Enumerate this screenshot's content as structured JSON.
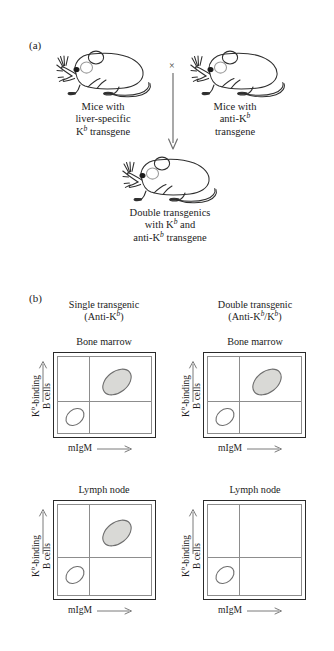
{
  "figure": {
    "panel_a": {
      "letter": "(a)",
      "parent_left": {
        "line1": "Mice with",
        "line2": "liver-specific",
        "line3_pre": "K",
        "line3_sup": "b",
        "line3_post": " transgene"
      },
      "parent_right": {
        "line1": "Mice with",
        "line2_pre": "anti-K",
        "line2_sup": "b",
        "line3": "transgene"
      },
      "cross_symbol": "×",
      "offspring": {
        "line1": "Double transgenics",
        "line2_pre": "with K",
        "line2_sup": "b",
        "line2_post": " and",
        "line3_pre": "anti-K",
        "line3_sup": "b",
        "line3_post": " transgene"
      }
    },
    "panel_b": {
      "letter": "(b)",
      "columns": [
        {
          "title_line1": "Single transgenic",
          "title_line2_pre": "(Anti-K",
          "title_line2_sup": "b",
          "title_line2_post": ")"
        },
        {
          "title_line1": "Double transgenic",
          "title_line2_pre": "(Anti-K",
          "title_line2_sup": "b",
          "title_line2_mid": "/K",
          "title_line2_sup2": "b",
          "title_line2_post": ")"
        }
      ],
      "axis": {
        "y_line1_pre": "K",
        "y_line1_sup": "b",
        "y_line1_post": "-binding",
        "y_line2": "B cells",
        "x_label": "mIgM"
      },
      "plots": [
        {
          "tissue": "Bone marrow",
          "genotype": "Single transgenic (Anti-Kb)",
          "populations": [
            {
              "name": "kb-binding-igm-positive",
              "quadrant": "upper-right",
              "fill": "gray"
            },
            {
              "name": "igm-negative-kb-negative",
              "quadrant": "lower-left",
              "fill": "white"
            }
          ]
        },
        {
          "tissue": "Bone marrow",
          "genotype": "Double transgenic (Anti-Kb/Kb)",
          "populations": [
            {
              "name": "kb-binding-igm-positive",
              "quadrant": "upper-right",
              "fill": "gray"
            },
            {
              "name": "igm-negative-kb-negative",
              "quadrant": "lower-left",
              "fill": "white"
            }
          ]
        },
        {
          "tissue": "Lymph node",
          "genotype": "Single transgenic (Anti-Kb)",
          "populations": [
            {
              "name": "kb-binding-igm-positive",
              "quadrant": "upper-right",
              "fill": "gray"
            },
            {
              "name": "igm-negative-kb-negative",
              "quadrant": "lower-left",
              "fill": "white"
            }
          ]
        },
        {
          "tissue": "Lymph node",
          "genotype": "Double transgenic (Anti-Kb/Kb)",
          "populations": [
            {
              "name": "igm-negative-kb-negative",
              "quadrant": "lower-left",
              "fill": "white"
            }
          ]
        }
      ]
    },
    "colors": {
      "blob_gray_fill": "#d9d9d6",
      "blob_outline": "#6e6e6e",
      "blob_white_fill": "#ffffff",
      "plot_outer_border": "#2a2a2a",
      "plot_inner_border": "#8d8d8d",
      "ink": "#1b1b1b",
      "background": "#ffffff"
    }
  }
}
